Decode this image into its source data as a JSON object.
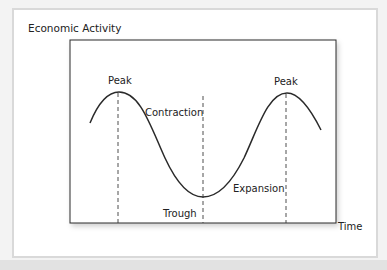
{
  "diagram": {
    "y_axis_label": "Economic Activity",
    "x_axis_label": "Time",
    "phases": [
      {
        "name": "peak_1",
        "label": "Peak"
      },
      {
        "name": "contraction",
        "label": "Contraction"
      },
      {
        "name": "trough",
        "label": "Trough"
      },
      {
        "name": "expansion",
        "label": "Expansion"
      },
      {
        "name": "peak_2",
        "label": "Peak"
      }
    ],
    "colors": {
      "line": "#2a2a2a",
      "dash": "#3a3a3a",
      "panel_border": "#d9d9d9",
      "text": "#222222"
    }
  }
}
